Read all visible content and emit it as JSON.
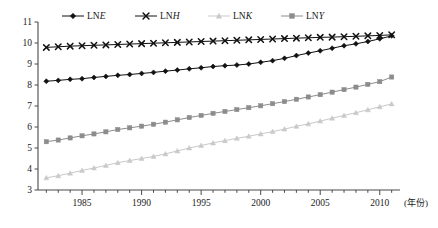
{
  "chart_data": {
    "type": "line",
    "title": "",
    "subtitle": "",
    "xlabel": "(年份)",
    "ylabel": "",
    "xlim": [
      1981.3,
      2011.7
    ],
    "ylim": [
      3,
      11
    ],
    "yticks": [
      3,
      4,
      5,
      6,
      7,
      8,
      9,
      10,
      11
    ],
    "ytick_labels": [
      "3",
      "4",
      "5",
      "6",
      "7",
      "8",
      "9",
      "10",
      "11"
    ],
    "xticks": [
      1985,
      1990,
      1995,
      2000,
      2005,
      2010
    ],
    "xtick_labels": [
      "1985",
      "1990",
      "1995",
      "2000",
      "2005",
      "2010"
    ],
    "xticks_minor_every": 1,
    "grid": false,
    "legend_position": "top",
    "x": [
      1982,
      1983,
      1984,
      1985,
      1986,
      1987,
      1988,
      1989,
      1990,
      1991,
      1992,
      1993,
      1994,
      1995,
      1996,
      1997,
      1998,
      1999,
      2000,
      2001,
      2002,
      2003,
      2004,
      2005,
      2006,
      2007,
      2008,
      2009,
      2010,
      2011
    ],
    "series": [
      {
        "name": "LNE",
        "marker": "diamond",
        "color": "#111111",
        "values": [
          8.18,
          8.22,
          8.27,
          8.3,
          8.36,
          8.41,
          8.46,
          8.5,
          8.55,
          8.6,
          8.66,
          8.71,
          8.77,
          8.82,
          8.88,
          8.92,
          8.95,
          9.0,
          9.08,
          9.16,
          9.27,
          9.4,
          9.52,
          9.63,
          9.75,
          9.87,
          9.96,
          10.07,
          10.2,
          10.34
        ]
      },
      {
        "name": "LNH",
        "marker": "cross",
        "color": "#111111",
        "values": [
          9.79,
          9.82,
          9.85,
          9.87,
          9.89,
          9.91,
          9.93,
          9.95,
          9.97,
          9.99,
          10.01,
          10.03,
          10.05,
          10.07,
          10.09,
          10.11,
          10.13,
          10.15,
          10.17,
          10.19,
          10.21,
          10.23,
          10.25,
          10.27,
          10.28,
          10.3,
          10.32,
          10.34,
          10.36,
          10.39
        ]
      },
      {
        "name": "LNK",
        "marker": "triangle",
        "color": "#c9c9c9",
        "values": [
          3.58,
          3.68,
          3.8,
          3.93,
          4.05,
          4.17,
          4.3,
          4.4,
          4.5,
          4.6,
          4.72,
          4.86,
          5.0,
          5.12,
          5.24,
          5.35,
          5.46,
          5.56,
          5.67,
          5.78,
          5.9,
          6.03,
          6.15,
          6.28,
          6.42,
          6.55,
          6.68,
          6.82,
          6.96,
          7.1
        ]
      },
      {
        "name": "LNY",
        "marker": "square",
        "color": "#8c8c8c",
        "values": [
          5.3,
          5.38,
          5.48,
          5.58,
          5.67,
          5.77,
          5.88,
          5.96,
          6.04,
          6.13,
          6.23,
          6.34,
          6.45,
          6.55,
          6.65,
          6.74,
          6.83,
          6.92,
          7.01,
          7.11,
          7.21,
          7.32,
          7.43,
          7.54,
          7.66,
          7.78,
          7.9,
          8.03,
          8.16,
          8.38
        ]
      }
    ],
    "legend": [
      {
        "label_prefix": "LN",
        "label_italic": "E",
        "marker": "diamond",
        "color": "#111111"
      },
      {
        "label_prefix": "LN",
        "label_italic": "H",
        "marker": "cross",
        "color": "#111111"
      },
      {
        "label_prefix": "LN",
        "label_italic": "K",
        "marker": "triangle",
        "color": "#c9c9c9"
      },
      {
        "label_prefix": "LN",
        "label_italic": "Y",
        "marker": "square",
        "color": "#8c8c8c"
      }
    ]
  },
  "colors": {
    "axis": "#4a4a4a",
    "text": "#1a1a1a",
    "background": "#ffffff"
  }
}
